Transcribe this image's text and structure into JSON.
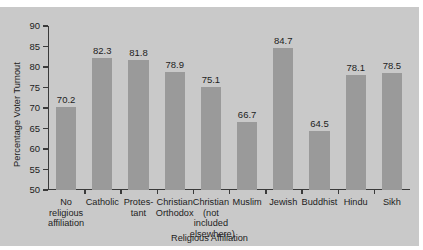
{
  "chart_data": {
    "type": "bar",
    "title": "",
    "xlabel": "Religious Affiliation",
    "ylabel": "Percentage Voter Turnout",
    "ylim": [
      50,
      90
    ],
    "ytick_step": 5,
    "yticks": [
      50,
      55,
      60,
      65,
      70,
      75,
      80,
      85,
      90
    ],
    "grid": false,
    "legend": null,
    "categories": [
      "No religious affiliation",
      "Catholic",
      "Protestant",
      "Christian Orthodox",
      "Christian (not included elsewhere)",
      "Muslim",
      "Jewish",
      "Buddhist",
      "Hindu",
      "Sikh"
    ],
    "category_lines": [
      [
        "No",
        "religious",
        "affiliation"
      ],
      [
        "Catholic"
      ],
      [
        "Protes-",
        "tant"
      ],
      [
        "Christian",
        "Orthodox"
      ],
      [
        "Christian",
        "(not",
        "included",
        "elsewhere)"
      ],
      [
        "Muslim"
      ],
      [
        "Jewish"
      ],
      [
        "Buddhist"
      ],
      [
        "Hindu"
      ],
      [
        "Sikh"
      ]
    ],
    "values": [
      70.2,
      82.3,
      81.8,
      78.9,
      75.1,
      66.7,
      84.7,
      64.5,
      78.1,
      78.5
    ],
    "value_labels": [
      "70.2",
      "82.3",
      "81.8",
      "78.9",
      "75.1",
      "66.7",
      "84.7",
      "64.5",
      "78.1",
      "78.5"
    ],
    "bar_color": "#9a9a9a",
    "background_color": "#c9c9c9",
    "axis_color": "#3a3a3a",
    "text_color": "#1d1d1d"
  }
}
